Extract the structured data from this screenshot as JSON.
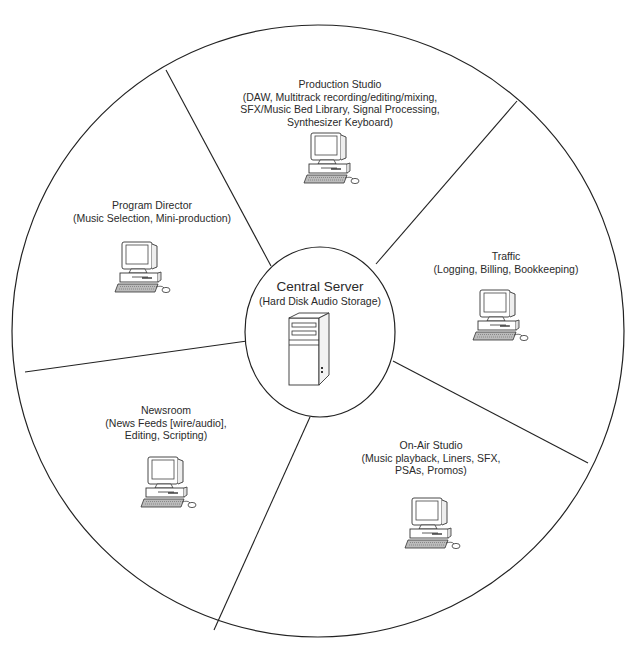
{
  "diagram": {
    "type": "hub-and-spoke pie",
    "center": {
      "title": "Central Server",
      "description": "(Hard Disk Audio Storage)",
      "icon": "server-tower-icon"
    },
    "nodes": [
      {
        "id": "production-studio",
        "title": "Production Studio",
        "description_lines": [
          "(DAW, Multitrack recording/editing/mixing,",
          "SFX/Music Bed Library, Signal Processing,",
          "Synthesizer Keyboard)"
        ],
        "icon": "desktop-computer-icon"
      },
      {
        "id": "traffic",
        "title": "Traffic",
        "description_lines": [
          "(Logging, Billing, Bookkeeping)"
        ],
        "icon": "desktop-computer-icon"
      },
      {
        "id": "on-air-studio",
        "title": "On-Air Studio",
        "description_lines": [
          "(Music playback, Liners, SFX,",
          "PSAs, Promos)"
        ],
        "icon": "desktop-computer-icon"
      },
      {
        "id": "newsroom",
        "title": "Newsroom",
        "description_lines": [
          "(News Feeds [wire/audio],",
          "Editing, Scripting)"
        ],
        "icon": "desktop-computer-icon"
      },
      {
        "id": "program-director",
        "title": "Program Director",
        "description_lines": [
          "(Music Selection, Mini-production)"
        ],
        "icon": "desktop-computer-icon"
      }
    ],
    "colors": {
      "line": "#222222",
      "background": "#ffffff",
      "text": "#2a2a2a"
    }
  }
}
